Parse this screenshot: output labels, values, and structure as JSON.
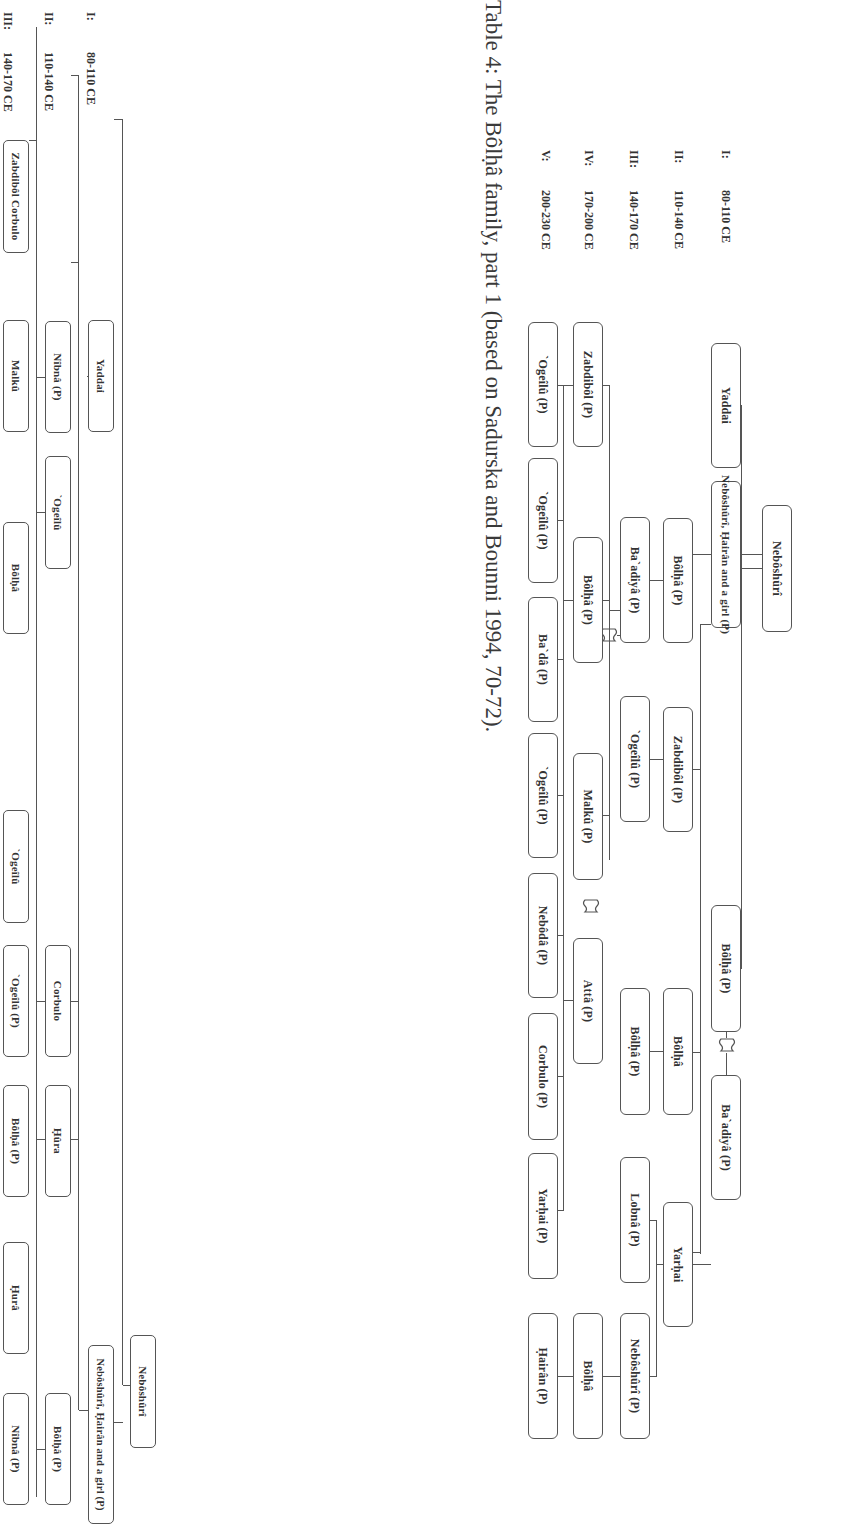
{
  "caption": "Table 4: The Bôlḥâ family, part 1 (based on Sadurska and Bounni 1994, 70-72).",
  "generations_top": [
    {
      "numeral": "I:",
      "range": "80-110 CE"
    },
    {
      "numeral": "II:",
      "range": "110-140 CE"
    },
    {
      "numeral": "III:",
      "range": "140-170 CE"
    },
    {
      "numeral": "IV:",
      "range": "170-200 CE"
    },
    {
      "numeral": "V:",
      "range": "200-230 CE"
    }
  ],
  "generations_bottom": [
    {
      "numeral": "I:",
      "range": "80-110 CE"
    },
    {
      "numeral": "II:",
      "range": "110-140 CE"
    },
    {
      "numeral": "III:",
      "range": "140-170 CE"
    }
  ],
  "tree1": {
    "root": "Nebôshûrî",
    "gen1": [
      "Yaddai",
      "Nebôshûrî, Ḥairân and a girl (P)",
      "Bôlḥâ (P)",
      "Ba`adiyâ (P)",
      "Yarḥai"
    ],
    "gen2": [
      "Bôlḥâ (P)",
      "Zabdibôl (P)",
      "Bôlḥâ",
      "Yarḥai"
    ],
    "gen3": [
      "Ba`adiyâ (P)",
      "`Ogeîlû (P)",
      "Bôlḥâ (P)",
      "Lobnâ (P)",
      "Nebôshûrî (P)"
    ],
    "gen4": [
      "Zabdibôl (P)",
      "Bôlḥâ (P)",
      "Malkû (P)",
      "Attâ (P)",
      "Bôlḥâ"
    ],
    "gen5": [
      "`Ogeîlû (P)",
      "`Ogeîlû (P)",
      "Ba`dâ (P)",
      "`Ogeîlû (P)",
      "Nebôdâ (P)",
      "Corbulo (P)",
      "Yarḥai (P)",
      "Ḥairân (P)"
    ]
  },
  "tree2": {
    "root": "Nebôshûrî",
    "gen1": [
      "Yaddai",
      "Nebôshûrî, Ḥairân and a girl (P)"
    ],
    "gen2": [
      "Nîbnâ (P)",
      "`Ogeîlû",
      "Corbulo",
      "Ḥûra",
      "Bôlḥâ (P)"
    ],
    "gen3": [
      "Zabdibôl Corbulo",
      "Malkû",
      "Bôlḥâ",
      "`Ogeîlû",
      "`Ogeîlû (P)",
      "Bôlḥâ (P)",
      "Ḥurâ",
      "Nîbnâ (P)"
    ]
  },
  "icons": {
    "marriage": "wavy-flag-icon"
  }
}
